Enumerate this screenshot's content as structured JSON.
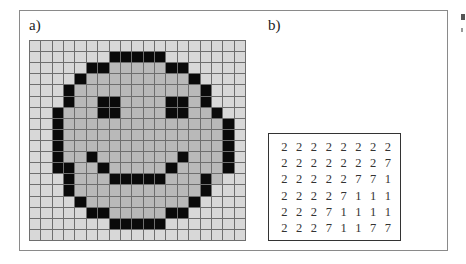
{
  "figure": {
    "panel_a": {
      "label": "a)",
      "grid": {
        "cols": 19,
        "rows": 18,
        "colors": {
          "background": "#d8d8d8",
          "fill": "#b9b9b9",
          "outline": "#0a0a0a",
          "gridline": "#6e6e6e"
        },
        "cells": [
          "...................",
          ".......KKKKK.......",
          ".....KKfffffKK.....",
          "....KfffffffffK....",
          "...KfffffffffffK...",
          "...KffKKffffKKfK...",
          "..KfffKKffffKKffK..",
          "..KffffffffffffffK.",
          "..KffffffffffffffK.",
          "..KffffffffffffffK.",
          "..KffKfffffffKfffK.",
          "..KKffKfffffKffffK.",
          "...KfffKKKKKfffKf..",
          "...KfffffffffffK...",
          "....KfffffffffK....",
          ".....KKfffffKK.....",
          ".......KKKKK.......",
          "..................."
        ]
      }
    },
    "panel_b": {
      "label": "b)",
      "matrix": [
        [
          "2",
          "2",
          "2",
          "2",
          "2",
          "2",
          "2",
          "2"
        ],
        [
          "2",
          "2",
          "2",
          "2",
          "2",
          "2",
          "2",
          "7"
        ],
        [
          "2",
          "2",
          "2",
          "2",
          "2",
          "7",
          "7",
          "1"
        ],
        [
          "2",
          "2",
          "2",
          "2",
          "7",
          "1",
          "1",
          "1"
        ],
        [
          "2",
          "2",
          "2",
          "7",
          "1",
          "1",
          "1",
          "1"
        ],
        [
          "2",
          "2",
          "2",
          "7",
          "1",
          "1",
          "7",
          "7"
        ]
      ]
    }
  }
}
